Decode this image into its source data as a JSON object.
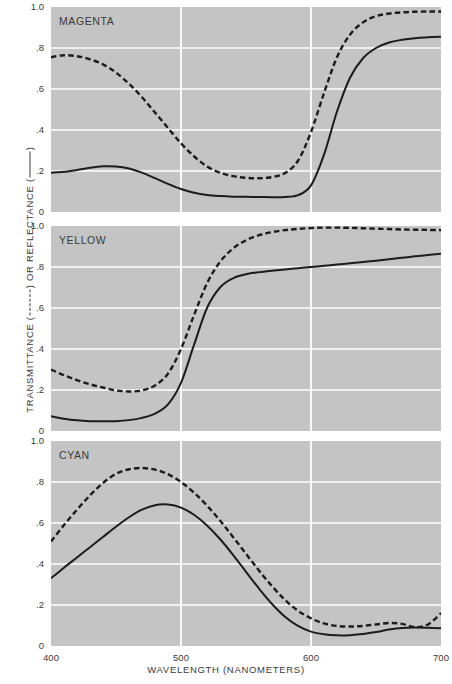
{
  "axes": {
    "xlabel": "WAVELENGTH (NANOMETERS)",
    "ylabel_prefix": "TRANSMITTANCE (",
    "ylabel_middle": ") OR REFLECTANCE (",
    "ylabel_suffix": ")",
    "xticks": [
      "400",
      "500",
      "600",
      "700"
    ],
    "yticks": [
      "1.0",
      ".8",
      ".6",
      ".4",
      ".2",
      "0"
    ]
  },
  "panels": [
    {
      "title": "MAGENTA"
    },
    {
      "title": "YELLOW"
    },
    {
      "title": "CYAN"
    }
  ],
  "chart_data": {
    "type": "line",
    "title": "",
    "xlabel": "WAVELENGTH (NANOMETERS)",
    "ylabel": "TRANSMITTANCE (-----) OR REFLECTANCE (—)",
    "xlim": [
      400,
      700
    ],
    "ylim": [
      0,
      1.0
    ],
    "xticks": [
      400,
      500,
      600,
      700
    ],
    "yticks": [
      0,
      0.2,
      0.4,
      0.6,
      0.8,
      1.0
    ],
    "grid": true,
    "legend": {
      "position": "in-axis-label",
      "entries": [
        {
          "name": "Transmittance",
          "style": "dashed"
        },
        {
          "name": "Reflectance",
          "style": "solid"
        }
      ]
    },
    "panels": [
      {
        "name": "MAGENTA",
        "series": [
          {
            "name": "Transmittance",
            "style": "dashed",
            "x": [
              400,
              410,
              420,
              430,
              440,
              450,
              460,
              470,
              480,
              490,
              500,
              510,
              520,
              530,
              540,
              550,
              560,
              570,
              580,
              590,
              600,
              610,
              620,
              630,
              640,
              650,
              660,
              670,
              680,
              690,
              700
            ],
            "values": [
              0.755,
              0.765,
              0.76,
              0.745,
              0.72,
              0.68,
              0.625,
              0.56,
              0.485,
              0.41,
              0.335,
              0.272,
              0.222,
              0.192,
              0.175,
              0.167,
              0.165,
              0.17,
              0.19,
              0.25,
              0.39,
              0.58,
              0.755,
              0.865,
              0.925,
              0.955,
              0.968,
              0.974,
              0.977,
              0.978,
              0.978
            ]
          },
          {
            "name": "Reflectance",
            "style": "solid",
            "x": [
              400,
              410,
              420,
              430,
              440,
              450,
              460,
              470,
              480,
              490,
              500,
              510,
              520,
              530,
              540,
              550,
              560,
              570,
              580,
              590,
              600,
              610,
              620,
              630,
              640,
              650,
              660,
              670,
              680,
              690,
              700
            ],
            "values": [
              0.192,
              0.196,
              0.205,
              0.216,
              0.223,
              0.222,
              0.212,
              0.192,
              0.165,
              0.137,
              0.112,
              0.094,
              0.083,
              0.078,
              0.075,
              0.074,
              0.073,
              0.072,
              0.073,
              0.082,
              0.13,
              0.28,
              0.49,
              0.655,
              0.75,
              0.8,
              0.827,
              0.84,
              0.848,
              0.852,
              0.855
            ]
          }
        ]
      },
      {
        "name": "YELLOW",
        "series": [
          {
            "name": "Transmittance",
            "style": "dashed",
            "x": [
              400,
              410,
              420,
              430,
              440,
              450,
              460,
              470,
              480,
              490,
              500,
              510,
              520,
              530,
              540,
              550,
              560,
              570,
              580,
              590,
              600,
              610,
              620,
              630,
              640,
              650,
              660,
              670,
              680,
              690,
              700
            ],
            "values": [
              0.3,
              0.272,
              0.248,
              0.228,
              0.212,
              0.198,
              0.193,
              0.198,
              0.222,
              0.28,
              0.4,
              0.565,
              0.72,
              0.825,
              0.89,
              0.93,
              0.955,
              0.97,
              0.98,
              0.986,
              0.99,
              0.992,
              0.992,
              0.991,
              0.989,
              0.987,
              0.985,
              0.983,
              0.982,
              0.981,
              0.98
            ]
          },
          {
            "name": "Reflectance",
            "style": "solid",
            "x": [
              400,
              410,
              420,
              430,
              440,
              450,
              460,
              470,
              480,
              490,
              500,
              510,
              520,
              530,
              540,
              550,
              560,
              570,
              580,
              590,
              600,
              610,
              620,
              630,
              640,
              650,
              660,
              670,
              680,
              690,
              700
            ],
            "values": [
              0.072,
              0.06,
              0.052,
              0.048,
              0.047,
              0.048,
              0.053,
              0.064,
              0.085,
              0.13,
              0.235,
              0.42,
              0.6,
              0.7,
              0.745,
              0.765,
              0.775,
              0.782,
              0.788,
              0.794,
              0.8,
              0.806,
              0.812,
              0.818,
              0.824,
              0.831,
              0.838,
              0.845,
              0.852,
              0.858,
              0.865
            ]
          }
        ]
      },
      {
        "name": "CYAN",
        "series": [
          {
            "name": "Transmittance",
            "style": "dashed",
            "x": [
              400,
              410,
              420,
              430,
              440,
              450,
              460,
              470,
              480,
              490,
              500,
              510,
              520,
              530,
              540,
              550,
              560,
              570,
              580,
              590,
              600,
              610,
              620,
              630,
              640,
              650,
              660,
              670,
              680,
              690,
              700
            ],
            "values": [
              0.51,
              0.59,
              0.665,
              0.735,
              0.795,
              0.84,
              0.862,
              0.868,
              0.86,
              0.838,
              0.8,
              0.748,
              0.685,
              0.612,
              0.532,
              0.45,
              0.368,
              0.292,
              0.225,
              0.172,
              0.135,
              0.11,
              0.098,
              0.095,
              0.098,
              0.105,
              0.112,
              0.108,
              0.092,
              0.105,
              0.16
            ]
          },
          {
            "name": "Reflectance",
            "style": "solid",
            "x": [
              400,
              410,
              420,
              430,
              440,
              450,
              460,
              470,
              480,
              490,
              500,
              510,
              520,
              530,
              540,
              550,
              560,
              570,
              580,
              590,
              600,
              610,
              620,
              630,
              640,
              650,
              660,
              670,
              680,
              690,
              700
            ],
            "values": [
              0.33,
              0.382,
              0.432,
              0.482,
              0.532,
              0.582,
              0.628,
              0.665,
              0.687,
              0.69,
              0.675,
              0.64,
              0.588,
              0.522,
              0.445,
              0.362,
              0.28,
              0.205,
              0.143,
              0.098,
              0.07,
              0.057,
              0.052,
              0.053,
              0.058,
              0.068,
              0.08,
              0.088,
              0.09,
              0.089,
              0.087
            ]
          }
        ]
      }
    ]
  }
}
